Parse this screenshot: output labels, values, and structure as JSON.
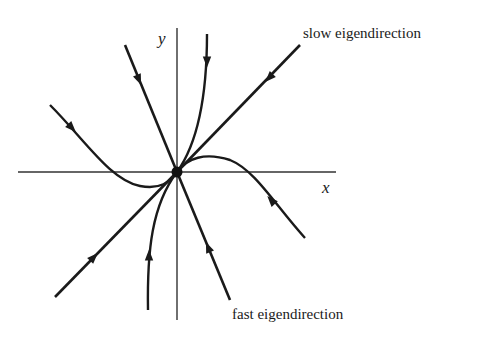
{
  "diagram": {
    "axes": {
      "x_label": "x",
      "y_label": "y"
    },
    "annotations": {
      "slow": "slow eigendirection",
      "fast": "fast eigendirection"
    },
    "fixed_point": {
      "type": "stable node",
      "x": 0,
      "y": 0
    },
    "trajectories": [
      {
        "id": "slow-upper",
        "kind": "straight",
        "along": "slow eigendirection",
        "direction": "toward origin"
      },
      {
        "id": "slow-lower",
        "kind": "straight",
        "along": "slow eigendirection",
        "direction": "toward origin"
      },
      {
        "id": "fast-upper",
        "kind": "straight",
        "along": "fast eigendirection",
        "direction": "toward origin"
      },
      {
        "id": "fast-lower",
        "kind": "straight",
        "along": "fast eigendirection",
        "direction": "toward origin"
      },
      {
        "id": "curve-top",
        "kind": "curved",
        "direction": "toward origin"
      },
      {
        "id": "curve-bottom",
        "kind": "curved",
        "direction": "toward origin"
      },
      {
        "id": "curve-left",
        "kind": "curved",
        "direction": "toward origin"
      },
      {
        "id": "curve-right",
        "kind": "curved",
        "direction": "toward origin"
      }
    ],
    "colors": {
      "ink": "#1a1a1a",
      "background": "#ffffff"
    }
  }
}
